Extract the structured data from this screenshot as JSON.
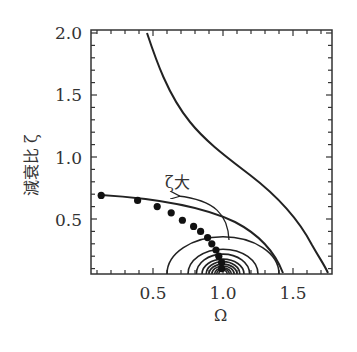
{
  "chart_data": {
    "type": "line",
    "title": "",
    "xlabel": "Ω",
    "ylabel": "減衰比 ζ",
    "xlim": [
      0.06,
      1.78
    ],
    "ylim": [
      0.06,
      2.0
    ],
    "xticks": [
      "0.5",
      "1.0",
      "1.5"
    ],
    "yticks": [
      "0.5",
      "1.0",
      "1.5",
      "2.0"
    ],
    "grid": false,
    "annotation": {
      "text": "ζ大",
      "arrow": "curved arrow pointing toward increasing ζ (upper-left)"
    },
    "series": [
      {
        "name": "outer boundary curve",
        "style": "line",
        "points": [
          [
            0.46,
            2.0
          ],
          [
            0.59,
            1.62
          ],
          [
            0.76,
            1.3
          ],
          [
            0.99,
            1.02
          ],
          [
            1.29,
            0.74
          ],
          [
            1.48,
            0.5
          ],
          [
            1.62,
            0.26
          ],
          [
            1.74,
            0.07
          ]
        ]
      },
      {
        "name": "upper arc",
        "style": "line",
        "points": [
          [
            0.13,
            0.69
          ],
          [
            0.6,
            0.64
          ],
          [
            0.95,
            0.55
          ],
          [
            1.2,
            0.4
          ],
          [
            1.33,
            0.22
          ],
          [
            1.43,
            0.07
          ]
        ]
      },
      {
        "name": "optimal points",
        "style": "markers",
        "points": [
          [
            0.13,
            0.69
          ],
          [
            0.39,
            0.65
          ],
          [
            0.53,
            0.6
          ],
          [
            0.63,
            0.55
          ],
          [
            0.71,
            0.49
          ],
          [
            0.79,
            0.44
          ],
          [
            0.84,
            0.4
          ],
          [
            0.89,
            0.35
          ],
          [
            0.92,
            0.3
          ],
          [
            0.95,
            0.25
          ],
          [
            0.97,
            0.2
          ],
          [
            0.99,
            0.15
          ],
          [
            0.99,
            0.1
          ]
        ]
      },
      {
        "name": "concentric contours around Ω=1.0",
        "style": "line",
        "center": [
          1.0,
          0.06
        ],
        "radii_omega": [
          0.4,
          0.25,
          0.19,
          0.15,
          0.12,
          0.1,
          0.08,
          0.06,
          0.045,
          0.03
        ],
        "radii_zeta": [
          0.3,
          0.2,
          0.16,
          0.12,
          0.1,
          0.08,
          0.065,
          0.05,
          0.04,
          0.03
        ]
      }
    ]
  },
  "labels": {
    "x_axis_title": "Ω",
    "y_axis_title": "減衰比 ζ",
    "x_tick_0": "0.5",
    "x_tick_1": "1.0",
    "x_tick_2": "1.5",
    "y_tick_0": "0.5",
    "y_tick_1": "1.0",
    "y_tick_2": "1.5",
    "y_tick_3": "2.0",
    "annotation": "ζ大"
  },
  "colors": {
    "line": "#222222",
    "text": "#333333"
  }
}
